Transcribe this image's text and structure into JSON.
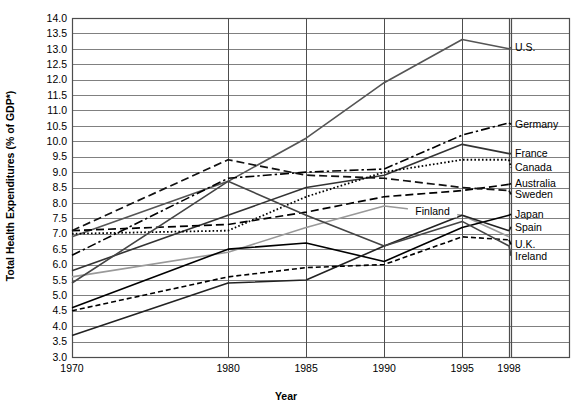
{
  "chart_data": {
    "type": "line",
    "title": "",
    "xlabel": "Year",
    "ylabel": "Total Health Expenditures (% of GDP*)",
    "x": [
      1970,
      1980,
      1985,
      1990,
      1995,
      1998
    ],
    "xticklabels": [
      "1970",
      "1980",
      "1985",
      "1990",
      "1995",
      "1998"
    ],
    "xlim": [
      1970,
      1998
    ],
    "ylim": [
      3.0,
      14.0
    ],
    "ytick_step": 0.5,
    "yticklabels": [
      "14.0",
      "13.5",
      "13.0",
      "12.5",
      "12.0",
      "11.5",
      "11.0",
      "10.5",
      "10.0",
      "9.5",
      "9.0",
      "8.5",
      "8.0",
      "7.5",
      "7.0",
      "6.5",
      "6.0",
      "5.5",
      "5.0",
      "4.5",
      "4.0",
      "3.5",
      "3.0"
    ],
    "grid": "horizontal-and-vertical",
    "legend_position": "right-inline-labels",
    "series": [
      {
        "name": "U.S.",
        "label": "U.S.",
        "style": "solid",
        "color": "#555555",
        "width": 1.6,
        "values": [
          6.9,
          8.7,
          10.1,
          11.9,
          13.3,
          13.0
        ]
      },
      {
        "name": "Germany",
        "label": "Germany",
        "style": "dashdot",
        "color": "#000000",
        "width": 1.6,
        "values": [
          6.3,
          8.8,
          9.0,
          9.1,
          10.2,
          10.6
        ]
      },
      {
        "name": "France",
        "label": "France",
        "style": "solid",
        "color": "#333333",
        "width": 1.6,
        "values": [
          5.8,
          7.6,
          8.5,
          8.9,
          9.9,
          9.6
        ]
      },
      {
        "name": "Canada",
        "label": "Canada",
        "style": "dotted",
        "color": "#000000",
        "width": 1.8,
        "values": [
          7.0,
          7.1,
          8.2,
          9.0,
          9.4,
          9.4
        ]
      },
      {
        "name": "Australia",
        "label": "Australia",
        "style": "longdash",
        "color": "#000000",
        "width": 1.7,
        "values": [
          7.1,
          7.3,
          7.7,
          8.2,
          8.4,
          8.6
        ]
      },
      {
        "name": "Sweden",
        "label": "Sweden",
        "style": "longdash",
        "color": "#111111",
        "width": 1.7,
        "values": [
          7.1,
          9.4,
          8.9,
          8.8,
          8.5,
          8.4
        ]
      },
      {
        "name": "Finland",
        "label": "Finland",
        "style": "solid",
        "color": "#999999",
        "width": 1.6,
        "values": [
          5.6,
          6.4,
          7.2,
          7.9,
          7.6,
          6.9
        ]
      },
      {
        "name": "Japan",
        "label": "Japan",
        "style": "solid",
        "color": "#000000",
        "width": 1.6,
        "values": [
          4.6,
          6.5,
          6.7,
          6.1,
          7.2,
          7.6
        ]
      },
      {
        "name": "Spain",
        "label": "Spain",
        "style": "solid",
        "color": "#222222",
        "width": 1.6,
        "values": [
          3.7,
          5.4,
          5.5,
          6.6,
          7.6,
          7.1
        ]
      },
      {
        "name": "U.K.",
        "label": "U.K.",
        "style": "dashed",
        "color": "#000000",
        "width": 1.6,
        "values": [
          4.5,
          5.6,
          5.9,
          6.0,
          6.9,
          6.8
        ]
      },
      {
        "name": "Ireland",
        "label": "Ireland",
        "style": "solid",
        "color": "#444444",
        "width": 1.6,
        "values": [
          5.4,
          8.7,
          7.6,
          6.6,
          7.4,
          6.6
        ]
      }
    ],
    "inline_labels": [
      {
        "text": "Finland",
        "x": 1993.1,
        "y": 7.72
      }
    ],
    "right_labels": [
      {
        "text": "U.S.",
        "y": 13.05
      },
      {
        "text": "Germany",
        "y": 10.55
      },
      {
        "text": "France",
        "y": 9.6
      },
      {
        "text": "Canada",
        "y": 9.15
      },
      {
        "text": "Australia",
        "y": 8.63
      },
      {
        "text": "Sweden",
        "y": 8.28
      },
      {
        "text": "Japan",
        "y": 7.63
      },
      {
        "text": "Spain",
        "y": 7.22
      },
      {
        "text": "U.K.",
        "y": 6.65
      },
      {
        "text": "Ireland",
        "y": 6.28
      }
    ]
  }
}
